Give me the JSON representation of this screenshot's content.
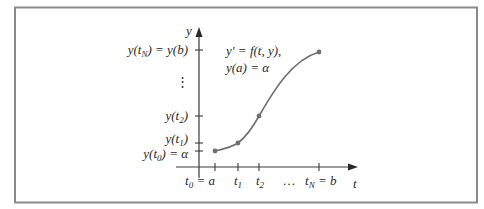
{
  "diagram": {
    "axes": {
      "y_label": "y",
      "t_label": "t"
    },
    "equation": {
      "line1": "y′ = f(t, y),",
      "line2": "y(a) = α"
    },
    "y_ticks": [
      {
        "label": "y(t_N) = y(b)"
      },
      {
        "label": "⋮"
      },
      {
        "label": "y(t_2)"
      },
      {
        "label": "y(t_1)"
      },
      {
        "label": "y(t_0) = α"
      }
    ],
    "t_ticks": [
      {
        "label": "t_0 = a"
      },
      {
        "label": "t_1"
      },
      {
        "label": "t_2"
      },
      {
        "label": "…"
      },
      {
        "label": "t_N = b"
      }
    ],
    "points": [
      {
        "name": "(t0, y(t0))"
      },
      {
        "name": "(t1, y(t1))"
      },
      {
        "name": "(t2, y(t2))"
      },
      {
        "name": "(tN, y(tN))"
      }
    ],
    "colors": {
      "frame": "#8a8a8a",
      "axis": "#3a3a3a",
      "curve": "#6f6f6f",
      "text": "#2a2a2a"
    }
  }
}
